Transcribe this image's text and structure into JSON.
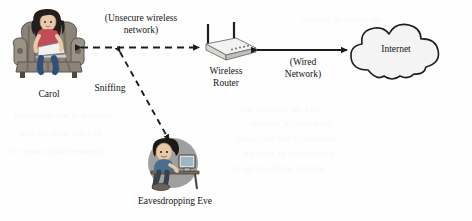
{
  "diagram": {
    "nodes": {
      "carol": {
        "label": "Carol",
        "icon": "person-in-armchair-with-laptop-icon"
      },
      "router": {
        "label": "Wireless\nRouter",
        "icon": "wireless-router-icon"
      },
      "internet": {
        "label": "Internet",
        "icon": "cloud-icon"
      },
      "eve": {
        "label": "Eavesdropping Eve",
        "icon": "person-at-desk-with-computer-icon"
      }
    },
    "links": {
      "wireless": {
        "label": "(Unsecure wireless\nnetwork)",
        "style": "dashed",
        "arrows": "both"
      },
      "wired": {
        "label": "(Wired\nNetwork)",
        "style": "solid",
        "arrows": "both"
      },
      "sniffing": {
        "label": "Sniffing",
        "style": "dashed",
        "arrows": "both"
      }
    },
    "colors": {
      "line": "#1d1d1d",
      "cloud_fill": "#f4f4f4",
      "cloud_stroke": "#1d1d1d",
      "router_body": "#e9e9e9",
      "eve_disc": "#8e8e8e",
      "chair": "#8a8278",
      "hair": "#231f1c",
      "skin": "#e8c9a8"
    },
    "background_bleed": [
      "and the security was",
      "the traffic of another",
      "network is not encrypted",
      "packets can be read by",
      "anyone within range of"
    ]
  }
}
